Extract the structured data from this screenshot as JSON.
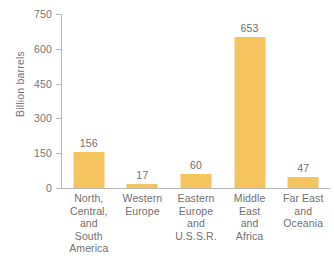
{
  "chart_data": {
    "type": "bar",
    "title": "",
    "xlabel": "",
    "ylabel": "Billion barrels",
    "categories": [
      "North, Central, and South America",
      "Western Europe",
      "Eastern Europe and U.S.S.R.",
      "Middle East and Africa",
      "Far East and Oceania"
    ],
    "category_lines": [
      [
        "North,",
        "Central,",
        "and",
        "South",
        "America"
      ],
      [
        "Western",
        "Europe"
      ],
      [
        "Eastern",
        "Europe",
        "and",
        "U.S.S.R."
      ],
      [
        "Middle",
        "East",
        "and",
        "Africa"
      ],
      [
        "Far East",
        "and",
        "Oceania"
      ]
    ],
    "values": [
      156,
      17,
      60,
      653,
      47
    ],
    "value_labels": [
      "156",
      "17",
      "60",
      "653",
      "47"
    ],
    "ylim": [
      0,
      750
    ],
    "yticks": [
      0,
      150,
      300,
      450,
      600,
      750
    ],
    "ytick_labels": [
      "0",
      "150",
      "300",
      "450",
      "600",
      "750"
    ],
    "grid": false,
    "legend": false,
    "bar_color": "#f5c45e",
    "axis_color": "#b9b9b9",
    "text_color": "#6f6f6f",
    "background_color": "#ffffff"
  }
}
